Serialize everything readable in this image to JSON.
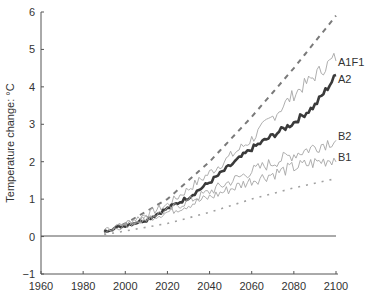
{
  "chart_data": {
    "type": "line",
    "title": "",
    "xlabel": "",
    "ylabel": "Temperature change: °C",
    "xlim": [
      1960,
      2100
    ],
    "ylim": [
      -1,
      6
    ],
    "x_ticks": [
      1960,
      1980,
      2000,
      2020,
      2040,
      2060,
      2080,
      2100
    ],
    "y_ticks": [
      -1,
      0,
      1,
      2,
      3,
      4,
      5,
      6
    ],
    "grid": false,
    "legend": "inline labels at right end of lines",
    "baseline": {
      "name": "zero line",
      "value": 0
    },
    "series": [
      {
        "name": "Upper envelope (dashed)",
        "style": "dashed",
        "x": [
          1990,
          2000,
          2020,
          2040,
          2060,
          2080,
          2100
        ],
        "values": [
          0.1,
          0.35,
          1.0,
          2.0,
          3.2,
          4.5,
          5.9
        ]
      },
      {
        "name": "A1F1",
        "style": "thin-noisy",
        "x": [
          1990,
          2000,
          2020,
          2040,
          2060,
          2080,
          2100
        ],
        "values": [
          0.15,
          0.35,
          0.85,
          1.7,
          2.6,
          3.8,
          4.8
        ]
      },
      {
        "name": "A2",
        "style": "thick-noisy",
        "x": [
          1990,
          2000,
          2010,
          2020,
          2030,
          2040,
          2050,
          2060,
          2070,
          2080,
          2090,
          2100
        ],
        "values": [
          0.15,
          0.3,
          0.45,
          0.75,
          1.05,
          1.45,
          1.9,
          2.35,
          2.7,
          3.05,
          3.5,
          4.3
        ]
      },
      {
        "name": "B2",
        "style": "thin-noisy",
        "x": [
          1990,
          2000,
          2020,
          2040,
          2060,
          2080,
          2100
        ],
        "values": [
          0.15,
          0.3,
          0.7,
          1.2,
          1.75,
          2.2,
          2.6
        ]
      },
      {
        "name": "B1",
        "style": "thin-noisy",
        "x": [
          1990,
          2000,
          2020,
          2040,
          2060,
          2080,
          2100
        ],
        "values": [
          0.15,
          0.3,
          0.65,
          1.05,
          1.5,
          1.85,
          2.1
        ]
      },
      {
        "name": "Lower envelope (dotted)",
        "style": "dotted",
        "x": [
          1990,
          2000,
          2020,
          2040,
          2060,
          2080,
          2100
        ],
        "values": [
          0.05,
          0.15,
          0.35,
          0.65,
          1.0,
          1.3,
          1.55
        ]
      }
    ]
  },
  "labels": {
    "y_axis_title": "Temperature change: °C",
    "series": {
      "A1F1": "A1F1",
      "A2": "A2",
      "B2": "B2",
      "B1": "B1"
    },
    "x_ticks": [
      "1960",
      "1980",
      "2000",
      "2020",
      "2040",
      "2060",
      "2080",
      "2100"
    ],
    "y_ticks": [
      "6",
      "5",
      "4",
      "3",
      "2",
      "1",
      "0",
      "−1"
    ]
  },
  "colors": {
    "axis": "#555555",
    "a2": "#3a3a3a",
    "thin": "#9a9a9a",
    "dashed": "#7a7a7a",
    "text": "#333333"
  }
}
